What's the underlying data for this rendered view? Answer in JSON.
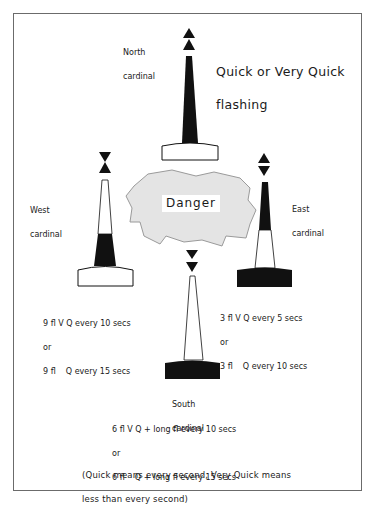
{
  "colors": {
    "black": "#111111",
    "danger_fill": "#e4e4e4",
    "danger_stroke": "#9a9a9a",
    "frame": "#6b6b6b"
  },
  "header": {
    "title_line1": "Quick or Very Quick",
    "title_line2": "flashing"
  },
  "danger": {
    "label": "Danger"
  },
  "buoys": {
    "north": {
      "name_line1": "North",
      "name_line2": "cardinal",
      "topmark": "two cones pointing up"
    },
    "west": {
      "name_line1": "West",
      "name_line2": "cardinal",
      "topmark": "two cones point to point"
    },
    "east": {
      "name_line1": "East",
      "name_line2": "cardinal",
      "topmark": "two cones base to base"
    },
    "south": {
      "name_line1": "South",
      "name_line2": "cardinal",
      "topmark": "two cones pointing down"
    }
  },
  "characteristics": {
    "west": {
      "line1": "9 fl V Q every 10 secs",
      "line2": "or",
      "line3": "9 fl    Q every 15 secs"
    },
    "east": {
      "line1": "3 fl V Q every 5 secs",
      "line2": "or",
      "line3": "3 fl    Q every 10 secs"
    },
    "south": {
      "line1": "6 fl V Q + long fl every 10 secs",
      "line2": "or",
      "line3": "6 fl    Q + long fl every 15 secs"
    }
  },
  "footnote": {
    "line1": "(Quick means every second, Very Quick means",
    "line2": "less than every second)"
  }
}
